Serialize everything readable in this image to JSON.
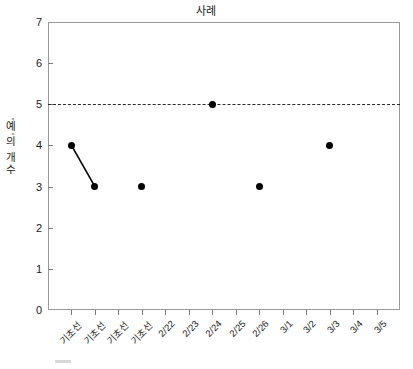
{
  "chart_data": {
    "type": "scatter",
    "title": "사례",
    "xlabel": "",
    "ylabel": "'예'의 개수",
    "ylim": [
      0,
      7
    ],
    "yticks": [
      0,
      1,
      2,
      3,
      4,
      5,
      6,
      7
    ],
    "grid": false,
    "legend": "none",
    "categories": [
      "기초선",
      "기초선",
      "기초선",
      "기초선",
      "2/22",
      "2/23",
      "2/24",
      "2/25",
      "2/26",
      "3/1",
      "3/2",
      "3/3",
      "3/4",
      "3/5"
    ],
    "points": [
      {
        "x_index": 0,
        "category": "기초선",
        "y": 4
      },
      {
        "x_index": 1,
        "category": "기초선",
        "y": 3
      },
      {
        "x_index": 3,
        "category": "기초선",
        "y": 3
      },
      {
        "x_index": 6,
        "category": "2/24",
        "y": 5
      },
      {
        "x_index": 8,
        "category": "2/26",
        "y": 3
      },
      {
        "x_index": 11,
        "category": "3/3",
        "y": 4
      }
    ],
    "connections": [
      {
        "from_index": 0,
        "to_index": 1
      }
    ],
    "reference_line": {
      "y": 5,
      "style": "dashed",
      "color": "#2b2b2b"
    },
    "colors": {
      "marker": "#000000",
      "line": "#000000",
      "frame": "#9a9a9a",
      "text": "#1a1a1a"
    }
  }
}
